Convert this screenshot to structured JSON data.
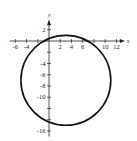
{
  "chart_data": {
    "type": "scatter",
    "subtype": "circle-graph",
    "title": "",
    "xlabel": "x",
    "ylabel": "y",
    "xlim": [
      -7,
      13.5
    ],
    "ylim": [
      -17,
      3.5
    ],
    "grid": false,
    "circle": {
      "center": [
        3,
        -7
      ],
      "radius": 8
    },
    "x_ticks": [
      -6,
      -4,
      -2,
      2,
      4,
      6,
      8,
      10,
      12
    ],
    "x_tick_labels": [
      "-6",
      "-4",
      "",
      "2",
      "4",
      "6",
      "",
      "10",
      "12"
    ],
    "y_ticks": [
      2,
      -2,
      -4,
      -6,
      -8,
      -10,
      -12,
      -14,
      -16
    ],
    "y_tick_labels": [
      "2",
      "",
      "-4",
      "-6",
      "-8",
      "-10",
      "",
      "",
      "-16"
    ]
  },
  "colors": {
    "curve": "#111111",
    "axis": "#222222"
  }
}
